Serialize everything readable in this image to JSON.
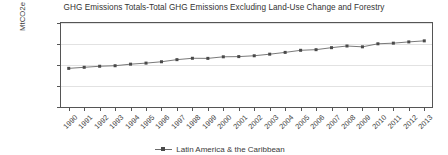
{
  "chart_data": {
    "type": "line",
    "title": "GHG Emissions Totals-Total GHG Emissions Excluding Land-Use Change and Forestry",
    "xlabel": "",
    "ylabel": "MtCO2e",
    "categories": [
      "1990",
      "1991",
      "1992",
      "1993",
      "1994",
      "1995",
      "1996",
      "1997",
      "1998",
      "1999",
      "2000",
      "2001",
      "2002",
      "2003",
      "2004",
      "2005",
      "2006",
      "2007",
      "2008",
      "2009",
      "2010",
      "2011",
      "2012",
      "2013"
    ],
    "series": [
      {
        "name": "Latin America & the Caribbean",
        "values": [
          1840,
          1890,
          1940,
          1965,
          2040,
          2090,
          2155,
          2255,
          2320,
          2315,
          2390,
          2400,
          2440,
          2515,
          2600,
          2700,
          2730,
          2825,
          2905,
          2865,
          3010,
          3040,
          3100,
          3150
        ]
      }
    ],
    "ylim": [
      0,
      4000
    ],
    "yticks": [
      0,
      1000,
      2000,
      3000,
      4000
    ],
    "ytick_labels": [
      "0",
      "1,000",
      "2,000",
      "3,000",
      "4,000"
    ],
    "grid": true,
    "legend_position": "bottom-right",
    "colors": {
      "line": "#6a6a6a",
      "marker": "#4a4a4a",
      "grid": "#e2e2e2",
      "axis": "#555555",
      "text": "#3a3a3a"
    }
  }
}
